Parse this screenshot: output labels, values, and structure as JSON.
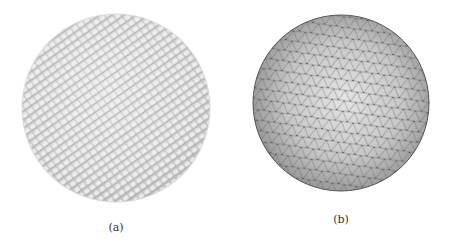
{
  "figure": {
    "panels": [
      {
        "id": "a",
        "caption": "(a)",
        "description": "sphere composed of voxel/particle lattice, textured diagonal rows",
        "center": [
          116,
          108
        ],
        "radius": 94,
        "fill_color": "#d4d4d4",
        "highlight_color": "#ececec",
        "shadow_color": "#a8a8a8"
      },
      {
        "id": "b",
        "caption": "(b)",
        "description": "sphere with triangulated surface mesh (geodesic), shaded",
        "center": [
          116,
          103
        ],
        "radius": 88,
        "fill_color": "#bdbdbd",
        "highlight_color": "#e8e8e8",
        "shadow_color": "#6e6e6e",
        "mesh_color": "#5a5a5a"
      }
    ]
  }
}
